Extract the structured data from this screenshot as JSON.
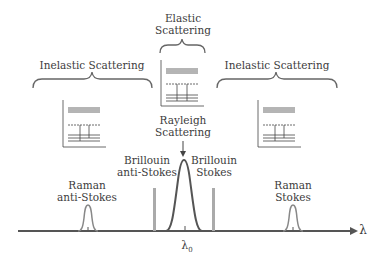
{
  "groups": {
    "left": {
      "label": "Inelastic Scattering",
      "panel_title": "Anti-Stokes"
    },
    "center": {
      "label_line1": "Elastic",
      "label_line2": "Scattering",
      "panel_title": "Rayleigh"
    },
    "right": {
      "label": "Inelastic Scattering",
      "panel_title": "Stokes"
    }
  },
  "peaks": {
    "rayleigh": {
      "line1": "Rayleigh",
      "line2": "Scattering"
    },
    "brillouin_anti": {
      "line1": "Brillouin",
      "line2": "anti-Stokes"
    },
    "brillouin_stokes": {
      "line1": "Brillouin",
      "line2": "Stokes"
    },
    "raman_anti": {
      "line1": "Raman",
      "line2": "anti-Stokes"
    },
    "raman_stokes": {
      "line1": "Raman",
      "line2": "Stokes"
    }
  },
  "axis": {
    "label": "λ",
    "center_label": "λ",
    "center_sub": "0"
  },
  "panel_axis_label": "E",
  "colors": {
    "line": "#555555",
    "panel_bg": "#ececec",
    "panel_border": "#9a9a9a",
    "bar": "#aaaaaa"
  }
}
